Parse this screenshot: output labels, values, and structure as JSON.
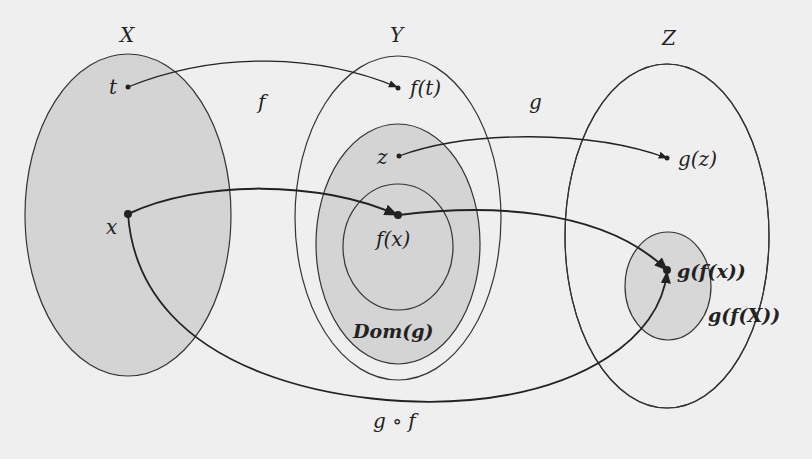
{
  "diagram": {
    "sets": {
      "X": {
        "label": "X"
      },
      "Y": {
        "label": "Y"
      },
      "Z": {
        "label": "Z"
      },
      "dom_g": {
        "label": "Dom(g)"
      },
      "g_f_X": {
        "label": "g(f(X))"
      }
    },
    "points": {
      "t": "t",
      "x": "x",
      "f_t": "f(t)",
      "z": "z",
      "f_x": "f(x)",
      "g_z": "g(z)",
      "g_f_x": "g(f(x))"
    },
    "maps": {
      "f": "f",
      "g": "g",
      "gof": "g ∘ f"
    },
    "colors": {
      "background": "#efefef",
      "fill": "#d4d4d4",
      "stroke": "#333333"
    }
  }
}
